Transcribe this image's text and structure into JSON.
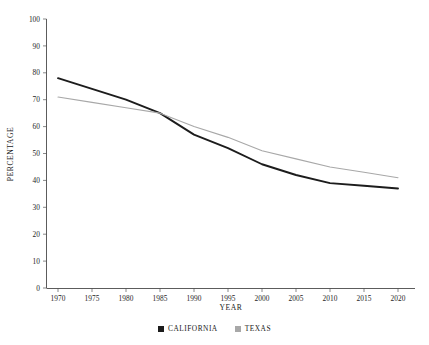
{
  "chart_data": {
    "type": "line",
    "title": "",
    "xlabel": "YEAR",
    "ylabel": "PERCENTAGE",
    "xlim": [
      1970,
      2020
    ],
    "ylim": [
      0,
      100
    ],
    "grid": false,
    "legend_position": "bottom-center",
    "x": [
      1970,
      1975,
      1980,
      1985,
      1990,
      1995,
      2000,
      2005,
      2010,
      2015,
      2020
    ],
    "xticks": [
      "1970",
      "1975",
      "1980",
      "1985",
      "1990",
      "1995",
      "2000",
      "2005",
      "2010",
      "2015",
      "2020"
    ],
    "yticks": [
      "0",
      "10",
      "20",
      "30",
      "40",
      "50",
      "60",
      "70",
      "80",
      "90",
      "100"
    ],
    "series": [
      {
        "name": "CALIFORNIA",
        "color": "#1c1c1c",
        "width": 1.9,
        "values": [
          78,
          74,
          70,
          65,
          57,
          52,
          46,
          42,
          39,
          38,
          37
        ]
      },
      {
        "name": "TEXAS",
        "color": "#a8a8a8",
        "width": 1.1,
        "values": [
          71,
          69,
          67,
          65,
          60,
          56,
          51,
          48,
          45,
          43,
          41
        ]
      }
    ]
  },
  "legend": {
    "items": [
      {
        "label": "CALIFORNIA",
        "color": "#1c1c1c"
      },
      {
        "label": "TEXAS",
        "color": "#a8a8a8"
      }
    ]
  },
  "axes": {
    "x_title": "YEAR",
    "y_title": "PERCENTAGE"
  }
}
